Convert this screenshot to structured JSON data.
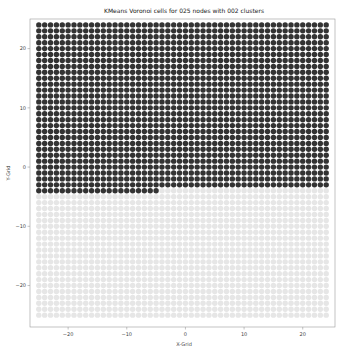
{
  "chart_data": {
    "type": "scatter",
    "title": "KMeans Voronoi cells for 025 nodes with 002 clusters",
    "xlabel": "X-Grid",
    "ylabel": "Y-Grid",
    "xlim": [
      -26.5,
      25.5
    ],
    "ylim": [
      -27,
      25
    ],
    "xticks": [
      -20,
      -10,
      0,
      10,
      20
    ],
    "yticks": [
      -20,
      -10,
      0,
      10,
      20
    ],
    "grid": false,
    "legend": null,
    "grid_points": {
      "x_range": [
        -25,
        24
      ],
      "y_range": [
        -25,
        24
      ],
      "step": 1
    },
    "series": [
      {
        "name": "cluster 0",
        "color": "#333333",
        "rule": "y >= -3 OR (y == -4 AND x <= -5)"
      },
      {
        "name": "cluster 1",
        "color": "#e6e6e6",
        "rule": "y <= -5 OR (y == -4 AND x > -5)"
      }
    ],
    "boundary": {
      "full_dark_min_y": -3,
      "partial_row_y": -4,
      "partial_row_max_x": -5
    }
  }
}
